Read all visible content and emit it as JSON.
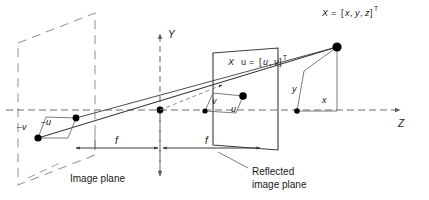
{
  "figure": {
    "background_color": "#ffffff",
    "solid_line_color": "#3a3a3a",
    "dashed_line_color": "#8a8a8a",
    "axis_dash_color": "#6e6e6e",
    "text_color": "#1a1a1a",
    "point_color": "#000000"
  },
  "axes": {
    "y_label": "Y",
    "z_label": "Z"
  },
  "labels": {
    "point_3d": {
      "X": "X",
      "equals": "=",
      "bracket_open": "[",
      "x": "x",
      "comma1": ",",
      "y": "y",
      "comma2": ",",
      "z": "z",
      "bracket_close": "]",
      "transpose": "T",
      "full": "X = [x, y, z]T"
    },
    "point_image": {
      "X": "X",
      "u": "u",
      "equals": "=",
      "bracket_open": "[",
      "u_comp": "u",
      "comma": ",",
      "v_comp": "v",
      "bracket_close": "]",
      "transpose": "T",
      "full": "X u = [u, v]T"
    },
    "image_plane_neg_v": "–v",
    "image_plane_neg_u": "–u",
    "reflected_v": "v",
    "reflected_u": "u",
    "world_y": "y",
    "world_x": "x",
    "focal_left": "f",
    "focal_right": "f",
    "image_plane_caption": "Image plane",
    "reflected_caption_line1": "Reflected",
    "reflected_caption_line2": "image plane"
  },
  "geometry": {
    "origin": {
      "x": 160,
      "y": 110
    },
    "image_plane_quad": [
      {
        "x": 18,
        "y": 43
      },
      {
        "x": 95,
        "y": 13
      },
      {
        "x": 95,
        "y": 155
      },
      {
        "x": 18,
        "y": 185
      }
    ],
    "reflected_plane_quad": [
      {
        "x": 213,
        "y": 53
      },
      {
        "x": 278,
        "y": 48
      },
      {
        "x": 278,
        "y": 150
      },
      {
        "x": 213,
        "y": 145
      }
    ],
    "image_point": {
      "x": 38,
      "y": 138
    },
    "image_point_corner": {
      "x": 76,
      "y": 118
    },
    "reflected_point": {
      "x": 243,
      "y": 96
    },
    "reflected_foot": {
      "x": 205,
      "y": 111
    },
    "world_point": {
      "x": 337,
      "y": 47
    },
    "world_foot": {
      "x": 297,
      "y": 111
    },
    "z_axis_y": 110,
    "y_axis_x": 160,
    "focal_left_span": [
      95,
      160
    ],
    "focal_right_span": [
      160,
      245
    ]
  }
}
